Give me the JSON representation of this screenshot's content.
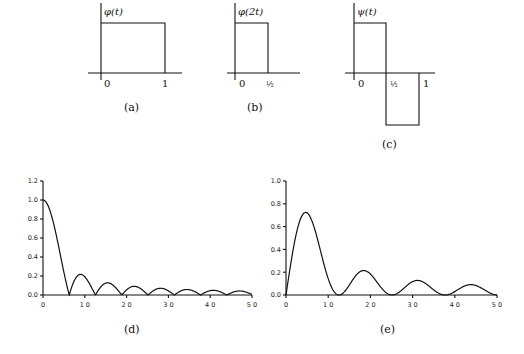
{
  "panels": {
    "a": {
      "function_label": "φ(t)",
      "tick_0": "0",
      "tick_1": "1",
      "caption": "(a)"
    },
    "b": {
      "function_label": "φ(2t)",
      "tick_0": "0",
      "tick_half": "½",
      "caption": "(b)"
    },
    "c": {
      "function_label": "ψ(t)",
      "tick_0": "0",
      "tick_half": "½",
      "tick_1": "1",
      "caption": "(c)"
    },
    "d": {
      "caption": "(d)",
      "yticks": [
        "0.0",
        "0.2",
        "0.4",
        "0.6",
        "0.8",
        "1.0",
        "1.2"
      ],
      "xticks": [
        "0",
        "10",
        "20",
        "30",
        "40",
        "50"
      ]
    },
    "e": {
      "caption": "(e)",
      "yticks": [
        "0.0",
        "0.2",
        "0.4",
        "0.6",
        "0.8",
        "1.0"
      ],
      "xticks": [
        "0",
        "10",
        "20",
        "30",
        "40",
        "50"
      ]
    }
  },
  "chart_data": [
    {
      "type": "line",
      "title": "(a) φ(t)",
      "x": [
        0,
        0,
        1,
        1
      ],
      "y": [
        0,
        1,
        1,
        0
      ],
      "xlabel": "t",
      "ylabel": "φ(t)"
    },
    {
      "type": "line",
      "title": "(b) φ(2t)",
      "x": [
        0,
        0,
        0.5,
        0.5
      ],
      "y": [
        0,
        1,
        1,
        0
      ],
      "xlabel": "t",
      "ylabel": "φ(2t)"
    },
    {
      "type": "line",
      "title": "(c) ψ(t)",
      "x": [
        0,
        0,
        0.5,
        0.5,
        1,
        1
      ],
      "y": [
        0,
        1,
        1,
        -1,
        -1,
        0
      ],
      "xlabel": "t",
      "ylabel": "ψ(t)"
    },
    {
      "type": "line",
      "title": "(d)",
      "x": [
        0,
        3.14,
        6.28,
        9.0,
        12.57,
        15.4,
        18.85,
        21.9,
        25.13,
        28.2,
        31.4,
        34.5,
        37.7,
        40.8,
        44.0,
        47.1,
        50
      ],
      "y": [
        1.0,
        0.64,
        0.0,
        0.22,
        0.0,
        0.13,
        0.0,
        0.09,
        0.0,
        0.07,
        0.0,
        0.06,
        0.0,
        0.05,
        0.0,
        0.04,
        0.0
      ],
      "xlim": [
        0,
        50
      ],
      "ylim": [
        0,
        1.2
      ],
      "grid": false
    },
    {
      "type": "line",
      "title": "(e)",
      "x": [
        0,
        4.7,
        12.57,
        18.6,
        25.13,
        31.1,
        37.7,
        43.6,
        50
      ],
      "y": [
        0.0,
        0.72,
        0.0,
        0.21,
        0.0,
        0.12,
        0.0,
        0.09,
        0.0
      ],
      "xlim": [
        0,
        50
      ],
      "ylim": [
        0,
        1.0
      ],
      "grid": false
    }
  ]
}
